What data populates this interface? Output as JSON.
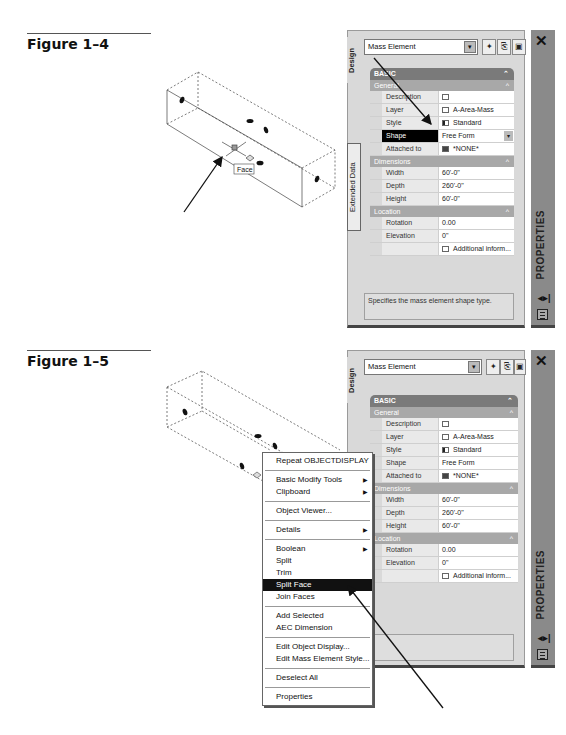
{
  "figures": [
    {
      "label": "Figure 1–4",
      "scene": {
        "tooltip": "Face"
      },
      "palette": {
        "tabs": [
          "Design",
          "Extended Data"
        ],
        "combo_value": "Mass Element",
        "combo_arrow": "▾",
        "toolbar_icons": [
          "select-objects",
          "quick-select",
          "toggle-pickadd"
        ],
        "header": "BASIC",
        "sections": [
          {
            "title": "General",
            "rows": [
              {
                "key": "Description",
                "value": "",
                "icon": "desc"
              },
              {
                "key": "Layer",
                "value": "A-Area-Mass",
                "icon": "layer"
              },
              {
                "key": "Style",
                "value": "Standard",
                "icon": "style"
              },
              {
                "key": "Shape",
                "value": "Free Form",
                "selected": true,
                "dropdown": true
              },
              {
                "key": "Attached to",
                "value": "*NONE*",
                "icon": "none"
              }
            ]
          },
          {
            "title": "Dimensions",
            "rows": [
              {
                "key": "Width",
                "value": "60'-0\""
              },
              {
                "key": "Depth",
                "value": "260'-0\""
              },
              {
                "key": "Height",
                "value": "60'-0\""
              }
            ]
          },
          {
            "title": "Location",
            "rows": [
              {
                "key": "Rotation",
                "value": "0.00"
              },
              {
                "key": "Elevation",
                "value": "0\""
              },
              {
                "key": "",
                "value": "Additional inform...",
                "icon": "desc"
              }
            ]
          }
        ],
        "hint": "Specifies the mass element shape type.",
        "side_title": "PROPERTIES",
        "close": "✕",
        "side_icon": "◂▸|"
      }
    },
    {
      "label": "Figure 1–5",
      "palette": {
        "tabs": [
          "Design"
        ],
        "combo_value": "Mass Element",
        "combo_arrow": "▾",
        "header": "BASIC",
        "sections": [
          {
            "title": "General",
            "rows": [
              {
                "key": "Description",
                "value": "",
                "icon": "desc"
              },
              {
                "key": "Layer",
                "value": "A-Area-Mass",
                "icon": "layer"
              },
              {
                "key": "Style",
                "value": "Standard",
                "icon": "style"
              },
              {
                "key": "Shape",
                "value": "Free Form"
              },
              {
                "key": "Attached to",
                "value": "*NONE*",
                "icon": "none"
              }
            ]
          },
          {
            "title": "Dimensions",
            "rows": [
              {
                "key": "Width",
                "value": "60'-0\""
              },
              {
                "key": "Depth",
                "value": "260'-0\""
              },
              {
                "key": "Height",
                "value": "60'-0\""
              }
            ]
          },
          {
            "title": "Location",
            "rows": [
              {
                "key": "Rotation",
                "value": "0.00"
              },
              {
                "key": "Elevation",
                "value": "0\""
              },
              {
                "key": "",
                "value": "Additional inform...",
                "icon": "desc"
              }
            ]
          }
        ],
        "hint": "",
        "side_title": "PROPERTIES",
        "close": "✕",
        "side_icon": "◂▸|"
      },
      "context_menu": {
        "items": [
          {
            "label": "Repeat OBJECTDISPLAY"
          },
          {
            "sep": true
          },
          {
            "label": "Basic Modify Tools",
            "submenu": true
          },
          {
            "label": "Clipboard",
            "submenu": true
          },
          {
            "sep": true
          },
          {
            "label": "Object Viewer..."
          },
          {
            "sep": true
          },
          {
            "label": "Details",
            "submenu": true
          },
          {
            "sep": true
          },
          {
            "label": "Boolean",
            "submenu": true
          },
          {
            "label": "Split"
          },
          {
            "label": "Trim"
          },
          {
            "label": "Split Face",
            "highlighted": true
          },
          {
            "label": "Join Faces"
          },
          {
            "sep": true
          },
          {
            "label": "Add Selected"
          },
          {
            "label": "AEC Dimension"
          },
          {
            "sep": true
          },
          {
            "label": "Edit Object Display..."
          },
          {
            "label": "Edit Mass Element Style..."
          },
          {
            "sep": true
          },
          {
            "label": "Deselect All"
          },
          {
            "sep": true
          },
          {
            "label": "Properties"
          }
        ],
        "submenu_glyph": "▶"
      }
    }
  ]
}
